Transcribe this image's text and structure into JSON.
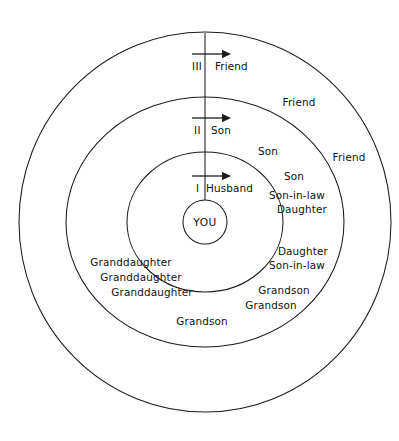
{
  "diagram": {
    "center": {
      "label": "YOU",
      "cx": 205,
      "cy": 222,
      "r": 22
    },
    "style": {
      "line_color": "#1c1c1c",
      "text_color": "#111111",
      "background": "#ffffff"
    },
    "rings": [
      {
        "numeral": "I",
        "title": "Husband",
        "rx": 78,
        "ry": 70,
        "numeral_x": 196,
        "numeral_y": 192,
        "title_x": 206,
        "title_y": 192,
        "arrow_y": 176,
        "arrow_x1": 192,
        "arrow_x2": 222
      },
      {
        "numeral": "II",
        "title": "Son",
        "rx": 139,
        "ry": 125,
        "numeral_x": 194,
        "numeral_y": 134,
        "title_x": 211,
        "title_y": 134,
        "arrow_y": 118,
        "arrow_x1": 192,
        "arrow_x2": 222
      },
      {
        "numeral": "III",
        "title": "Friend",
        "rx": 186,
        "ry": 190,
        "numeral_x": 192,
        "numeral_y": 70,
        "title_x": 215,
        "title_y": 70,
        "arrow_y": 54,
        "arrow_x1": 192,
        "arrow_x2": 222
      }
    ],
    "axis": {
      "x": 205,
      "y_top": 33,
      "y_bottom": 200
    },
    "members": [
      {
        "label": "Friend",
        "x": 299,
        "y": 106,
        "anchor": "middle",
        "ring": 3
      },
      {
        "label": "Friend",
        "x": 349,
        "y": 161,
        "anchor": "middle",
        "ring": 3
      },
      {
        "label": "Son",
        "x": 268,
        "y": 155,
        "anchor": "middle",
        "ring": 2
      },
      {
        "label": "Son",
        "x": 294,
        "y": 180,
        "anchor": "middle",
        "ring": 2
      },
      {
        "label": "Son-in-law",
        "x": 297,
        "y": 199,
        "anchor": "middle",
        "ring": 2
      },
      {
        "label": "Daughter",
        "x": 302,
        "y": 213,
        "anchor": "middle",
        "ring": 2
      },
      {
        "label": "Daughter",
        "x": 303,
        "y": 255,
        "anchor": "middle",
        "ring": 2
      },
      {
        "label": "Son-in-law",
        "x": 297,
        "y": 269,
        "anchor": "middle",
        "ring": 2
      },
      {
        "label": "Grandson",
        "x": 284,
        "y": 294,
        "anchor": "middle",
        "ring": 2
      },
      {
        "label": "Grandson",
        "x": 271,
        "y": 309,
        "anchor": "middle",
        "ring": 2
      },
      {
        "label": "Grandson",
        "x": 202,
        "y": 325,
        "anchor": "middle",
        "ring": 2
      },
      {
        "label": "Granddaughter",
        "x": 131,
        "y": 266,
        "anchor": "middle",
        "ring": 2
      },
      {
        "label": "Granddaughter",
        "x": 141,
        "y": 281,
        "anchor": "middle",
        "ring": 2
      },
      {
        "label": "Granddaughter",
        "x": 152,
        "y": 296,
        "anchor": "middle",
        "ring": 2
      }
    ]
  }
}
